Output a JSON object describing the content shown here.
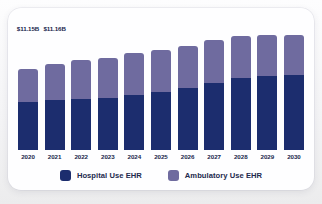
{
  "theme": {
    "page_background": "#f4f4f6",
    "card_background": "#fefeff",
    "hospital_color": "#1c2d6e",
    "ambulatory_color": "#6f6b9f",
    "text_color": "#20264b"
  },
  "legend": {
    "position": "bottom-center",
    "items": [
      {
        "label": "Hospital Use EHR",
        "color": "#1c2d6e",
        "swatch": "legend-swatch-hospital"
      },
      {
        "label": "Ambulatory Use EHR",
        "color": "#6f6b9f",
        "swatch": "legend-swatch-ambulatory"
      }
    ]
  },
  "chart_data": {
    "type": "bar",
    "stacked": true,
    "title": "",
    "subtitle": "",
    "xlabel": "",
    "ylabel": "",
    "grid": false,
    "axis_line": false,
    "ylim": [
      0,
      26
    ],
    "categories": [
      "2020",
      "2021",
      "2022",
      "2023",
      "2024",
      "2025",
      "2026",
      "2027",
      "2028",
      "2029",
      "2030"
    ],
    "series": [
      {
        "name": "Hospital Use EHR",
        "color": "#1c2d6e",
        "values": [
          7.0,
          7.1,
          7.4,
          7.7,
          8.1,
          8.7,
          9.4,
          10.3,
          11.2,
          12.1,
          13.2
        ]
      },
      {
        "name": "Ambulatory Use EHR",
        "color": "#6f6b9f",
        "values": [
          4.15,
          4.06,
          4.3,
          4.4,
          4.6,
          4.7,
          4.8,
          4.9,
          5.1,
          5.4,
          5.8
        ]
      }
    ],
    "totals": [
      11.15,
      11.16,
      11.7,
      12.1,
      12.7,
      13.4,
      14.2,
      15.2,
      16.3,
      17.5,
      19.0
    ],
    "data_labels": [
      {
        "category": "2020",
        "text": "$11.15B"
      },
      {
        "category": "2021",
        "text": "$11.16B"
      }
    ],
    "bar_pixel_totals": [
      81,
      86,
      90,
      92,
      97,
      100,
      104,
      110,
      114,
      120,
      128
    ],
    "bar_pixel_bottom": [
      48,
      50,
      51,
      52,
      55,
      58,
      62,
      67,
      72,
      77,
      83
    ]
  }
}
